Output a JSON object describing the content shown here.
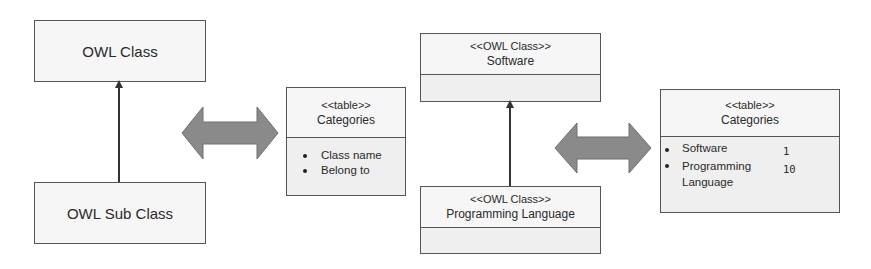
{
  "left_diagram": {
    "parent_class": "OWL Class",
    "child_class": "OWL Sub Class",
    "relation": "inheritance"
  },
  "left_table": {
    "stereotype": "<<table>>",
    "name": "Categories",
    "columns": [
      "Class name",
      "Belong to"
    ]
  },
  "right_diagram": {
    "parent": {
      "stereotype": "<<OWL Class>>",
      "name": "Software"
    },
    "child": {
      "stereotype": "<<OWL Class>>",
      "name": "Programming Language"
    },
    "relation": "inheritance"
  },
  "right_table": {
    "stereotype": "<<table>>",
    "name": "Categories",
    "rows": [
      {
        "class_name": "Software",
        "belong_to": "1"
      },
      {
        "class_name": "Programming",
        "class_name_cont": "Language",
        "belong_to": "10"
      }
    ]
  },
  "mappings": [
    {
      "from": "left_diagram",
      "to": "left_table",
      "type": "bidirectional"
    },
    {
      "from": "right_diagram",
      "to": "right_table",
      "type": "bidirectional"
    }
  ],
  "colors": {
    "border": "#555555",
    "box_fill": "#f6f6f6",
    "arrow_fill": "#8a8a8a"
  }
}
